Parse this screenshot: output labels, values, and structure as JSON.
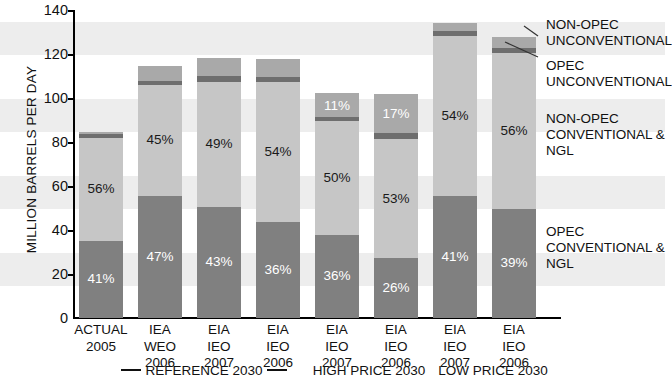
{
  "chart_data": {
    "type": "bar",
    "subtype": "stacked",
    "title": "",
    "xlabel": "",
    "ylabel": "MILLION BARRELS PER DAY",
    "ylim": [
      0,
      140
    ],
    "ytick_values": [
      0,
      20,
      40,
      60,
      80,
      100,
      120,
      140
    ],
    "ytick_labels": [
      "0",
      "20",
      "40",
      "60",
      "80",
      "100",
      "120",
      "140"
    ],
    "grid": false,
    "banded_background": true,
    "legend_position": "right",
    "categories": [
      {
        "lines": [
          "ACTUAL",
          "2005"
        ]
      },
      {
        "lines": [
          "IEA",
          "WEO",
          "2006"
        ]
      },
      {
        "lines": [
          "EIA",
          "IEO",
          "2007"
        ]
      },
      {
        "lines": [
          "EIA",
          "IEO",
          "2006"
        ]
      },
      {
        "lines": [
          "EIA",
          "IEO",
          "2007"
        ]
      },
      {
        "lines": [
          "EIA",
          "IEO",
          "2006"
        ]
      },
      {
        "lines": [
          "EIA",
          "IEO",
          "2007"
        ]
      },
      {
        "lines": [
          "EIA",
          "IEO",
          "2006"
        ]
      }
    ],
    "series": [
      {
        "name": "OPEC CONVENTIONAL & NGL",
        "color": "#808080",
        "values": [
          35.0,
          55.5,
          50.5,
          43.5,
          37.5,
          27.0,
          55.5,
          49.5
        ],
        "labels": [
          "41%",
          "47%",
          "43%",
          "36%",
          "36%",
          "26%",
          "41%",
          "39%"
        ],
        "label_color": "#ffffff"
      },
      {
        "name": "NON-OPEC CONVENTIONAL & NGL",
        "color": "#c6c6c6",
        "values": [
          47.0,
          50.5,
          57.0,
          64.0,
          52.0,
          54.5,
          73.0,
          71.0
        ],
        "labels": [
          "56%",
          "45%",
          "49%",
          "54%",
          "50%",
          "53%",
          "54%",
          "56%"
        ],
        "label_color": "#1a1a1a"
      },
      {
        "name": "OPEC UNCONVENTIONAL",
        "color": "#6e6e6e",
        "values": [
          1.5,
          2.0,
          2.5,
          2.0,
          2.0,
          2.5,
          2.0,
          2.5
        ],
        "labels": [
          "",
          "",
          "",
          "",
          "",
          "",
          "",
          ""
        ],
        "label_color": "#ffffff"
      },
      {
        "name": "NON-OPEC UNCONVENTIONAL",
        "color": "#a9a9a9",
        "values": [
          1.0,
          6.5,
          8.5,
          8.5,
          11.0,
          18.0,
          4.0,
          5.0
        ],
        "labels": [
          "",
          "",
          "",
          "",
          "11%",
          "17%",
          "",
          ""
        ],
        "label_color": "#ffffff"
      }
    ],
    "totals": [
      84.5,
      114.5,
      118.5,
      118.0,
      102.5,
      102.0,
      134.5,
      128.0
    ],
    "group_brackets": [
      {
        "label": "REFERENCE 2030",
        "rule": true,
        "spans": [
          1,
          2,
          3
        ]
      },
      {
        "label": "HIGH PRICE 2030",
        "rule": false,
        "spans": [
          4,
          5
        ]
      },
      {
        "label": "LOW PRICE 2030",
        "rule": false,
        "spans": [
          6,
          7
        ]
      }
    ]
  },
  "legend": {
    "items": [
      {
        "text": "NON-OPEC\nUNCONVENTIONAL"
      },
      {
        "text": "OPEC\nUNCONVENTIONAL"
      },
      {
        "text": "NON-OPEC\nCONVENTIONAL & NGL"
      },
      {
        "text": "OPEC\nCONVENTIONAL & NGL"
      }
    ]
  },
  "axis": {
    "y_title": "MILLION BARRELS PER DAY",
    "ticks": [
      "140",
      "120",
      "100",
      "80",
      "60",
      "40",
      "20",
      "0"
    ]
  },
  "groups": {
    "reference": "REFERENCE 2030",
    "high_price": "HIGH PRICE 2030",
    "low_price": "LOW PRICE 2030"
  },
  "colors": {
    "opec_conventional": "#808080",
    "nonopec_conventional": "#c6c6c6",
    "opec_unconventional": "#6e6e6e",
    "nonopec_unconventional": "#a9a9a9",
    "band": "#ededed",
    "axis": "#000000"
  }
}
